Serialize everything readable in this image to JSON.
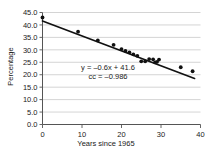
{
  "chart_data": {
    "type": "scatter",
    "title": "",
    "xlabel": "Years since 1965",
    "ylabel": "Percentage",
    "xlim": [
      0,
      40
    ],
    "ylim": [
      0,
      45
    ],
    "xticks": [
      "0",
      "10",
      "20",
      "30",
      "40"
    ],
    "xtick_values": [
      0,
      10,
      20,
      30,
      40
    ],
    "yticks": [
      "0.0",
      "5.0",
      "10.0",
      "15.0",
      "20.0",
      "25.0",
      "30.0",
      "35.0",
      "40.0",
      "45.0"
    ],
    "ytick_values": [
      0,
      5,
      10,
      15,
      20,
      25,
      30,
      35,
      40,
      45
    ],
    "grid": "horizontal",
    "legend": "none",
    "marker_color": "#111111",
    "line_color": "#111111",
    "grid_color": "#c9c9c9",
    "axis_color": "#555555",
    "points": [
      {
        "x": 0,
        "y": 43.0
      },
      {
        "x": 9,
        "y": 37.3
      },
      {
        "x": 14,
        "y": 33.8
      },
      {
        "x": 18,
        "y": 32.0
      },
      {
        "x": 20,
        "y": 30.3
      },
      {
        "x": 21,
        "y": 29.6
      },
      {
        "x": 22,
        "y": 29.0
      },
      {
        "x": 23,
        "y": 28.2
      },
      {
        "x": 24,
        "y": 27.6
      },
      {
        "x": 25,
        "y": 25.4
      },
      {
        "x": 26,
        "y": 25.4
      },
      {
        "x": 27,
        "y": 26.3
      },
      {
        "x": 28,
        "y": 26.2
      },
      {
        "x": 28.5,
        "y": 25.0
      },
      {
        "x": 29,
        "y": 25.2
      },
      {
        "x": 29.5,
        "y": 26.1
      },
      {
        "x": 35,
        "y": 23.0
      },
      {
        "x": 38,
        "y": 21.4
      }
    ],
    "fit_line": {
      "slope": -0.6,
      "intercept": 41.6,
      "equation_label": "y = –0.6x + 41.6",
      "cc_label": "cc = –0.986",
      "correlation_coefficient": -0.986,
      "x_start": 0,
      "x_end": 38.5
    }
  }
}
